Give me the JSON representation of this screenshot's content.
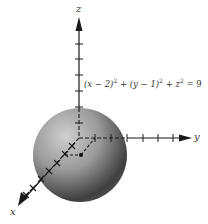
{
  "figure": {
    "axes": {
      "x_label": "x",
      "y_label": "y",
      "z_label": "z"
    },
    "equation": {
      "lhs_1": "(x − 2)",
      "exp_1": "2",
      "plus_1": " + ",
      "lhs_2": "(y − 1)",
      "exp_2": "2",
      "plus_2": " + ",
      "lhs_3": "z",
      "exp_3": "2",
      "rhs": " = 9"
    },
    "sphere": {
      "center": [
        2,
        1,
        0
      ],
      "radius": 3,
      "shade_light": "#c8c8c8",
      "shade_dark": "#3a3a3a"
    },
    "colors": {
      "axis": "#1a1a1a",
      "background": "#ffffff"
    }
  }
}
